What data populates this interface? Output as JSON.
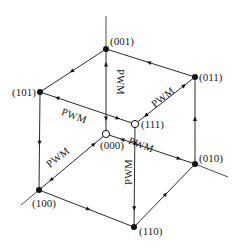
{
  "diagram": {
    "title": "",
    "colors": {
      "line": "#2a2a2a",
      "node_filled": "#111111",
      "node_open_fill": "#ffffff"
    },
    "vertices": [
      {
        "id": "001",
        "label": "(001)",
        "x": 106,
        "y": 49,
        "filled": true,
        "lx": 110,
        "ly": 45
      },
      {
        "id": "101",
        "label": "(101)",
        "x": 40,
        "y": 92,
        "filled": true,
        "lx": 12,
        "ly": 96
      },
      {
        "id": "011",
        "label": "(011)",
        "x": 195,
        "y": 77,
        "filled": true,
        "lx": 199,
        "ly": 81
      },
      {
        "id": "111",
        "label": "(111)",
        "x": 135,
        "y": 124,
        "filled": false,
        "lx": 141,
        "ly": 128
      },
      {
        "id": "000",
        "label": "(000)",
        "x": 106,
        "y": 134,
        "filled": false,
        "lx": 100,
        "ly": 149
      },
      {
        "id": "010",
        "label": "(010)",
        "x": 195,
        "y": 164,
        "filled": true,
        "lx": 199,
        "ly": 162
      },
      {
        "id": "100",
        "label": "(100)",
        "x": 39,
        "y": 190,
        "filled": true,
        "lx": 32,
        "ly": 207
      },
      {
        "id": "110",
        "label": "(110)",
        "x": 134,
        "y": 227,
        "filled": true,
        "lx": 139,
        "ly": 235
      }
    ],
    "edges": [
      {
        "from": "001",
        "to": "101",
        "type": "single"
      },
      {
        "from": "011",
        "to": "001",
        "type": "single"
      },
      {
        "from": "010",
        "to": "011",
        "type": "single"
      },
      {
        "from": "101",
        "to": "100",
        "type": "single"
      },
      {
        "from": "100",
        "to": "110",
        "type": "single"
      },
      {
        "from": "110",
        "to": "010",
        "type": "single"
      },
      {
        "from": "000",
        "to": "001",
        "type": "pwm",
        "label": "PWM"
      },
      {
        "from": "000",
        "to": "100",
        "type": "pwm",
        "label": "PWM"
      },
      {
        "from": "000",
        "to": "010",
        "type": "pwm",
        "label": "PWM"
      },
      {
        "from": "111",
        "to": "011",
        "type": "pwm",
        "label": "PWM"
      },
      {
        "from": "111",
        "to": "101",
        "type": "pwm",
        "label": "PWM"
      },
      {
        "from": "111",
        "to": "110",
        "type": "pwm",
        "label": "PWM"
      }
    ],
    "axes": [
      {
        "name": "z-axis",
        "x1": 106,
        "y1": 16,
        "x2": 106,
        "y2": 49
      },
      {
        "name": "x-axis",
        "x1": 39,
        "y1": 190,
        "x2": 21,
        "y2": 205
      },
      {
        "name": "y-axis",
        "x1": 195,
        "y1": 164,
        "x2": 228,
        "y2": 177
      }
    ],
    "pwm_labels": [
      {
        "text": "PWM",
        "x": 117,
        "y": 82,
        "rotate": 90
      },
      {
        "text": "PWM",
        "x": 165,
        "y": 100,
        "rotate": -38
      },
      {
        "text": "PWM",
        "x": 73,
        "y": 119,
        "rotate": 20
      },
      {
        "text": "PWM",
        "x": 60,
        "y": 160,
        "rotate": -38
      },
      {
        "text": "PWM",
        "x": 140,
        "y": 148,
        "rotate": 20
      },
      {
        "text": "PWM",
        "x": 132,
        "y": 172,
        "rotate": -90
      }
    ]
  }
}
